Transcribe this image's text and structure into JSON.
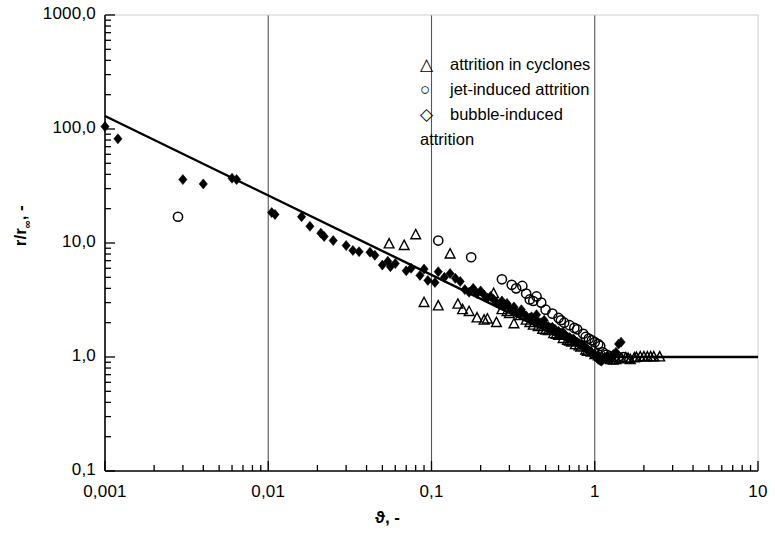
{
  "chart_data": {
    "type": "scatter",
    "title": "",
    "xlabel": "ϑ, -",
    "ylabel": "r/r∞, -",
    "xscale": "log",
    "yscale": "log",
    "xlim": [
      0.001,
      10
    ],
    "ylim": [
      0.1,
      1000
    ],
    "xticks": [
      "0,001",
      "0,01",
      "0,1",
      "1",
      "10"
    ],
    "xtick_values": [
      0.001,
      0.01,
      0.1,
      1,
      10
    ],
    "yticks": [
      "0,1",
      "1,0",
      "10,0",
      "100,0",
      "1000,0"
    ],
    "ytick_values": [
      0.1,
      1,
      10,
      100,
      1000
    ],
    "grid": "vertical gridlines at x = 0,01 / 0,1 / 1",
    "legend_position": "top-right inside axes",
    "legend": [
      {
        "marker": "triangle-open",
        "label": "attrition in cyclones"
      },
      {
        "marker": "circle-open",
        "label": "jet-induced attrition"
      },
      {
        "marker": "diamond-open",
        "label": "bubble-induced attrition"
      }
    ],
    "annotations": [
      {
        "text": "fit line: power law r/r∞ ≈ ϑ^-0,5 for ϑ < 1, constant r/r∞ = 1 for ϑ > 1"
      }
    ],
    "series": [
      {
        "name": "filled diamonds (measured data)",
        "marker": "diamond-filled",
        "color": "#000000",
        "points": [
          [
            0.001,
            105
          ],
          [
            0.0012,
            82
          ],
          [
            0.003,
            36
          ],
          [
            0.004,
            33
          ],
          [
            0.006,
            37
          ],
          [
            0.0064,
            36
          ],
          [
            0.0105,
            18.5
          ],
          [
            0.011,
            17.8
          ],
          [
            0.016,
            17.0
          ],
          [
            0.021,
            12.2
          ],
          [
            0.022,
            11.4
          ],
          [
            0.033,
            8.6
          ],
          [
            0.036,
            8.4
          ],
          [
            0.042,
            8.3
          ],
          [
            0.05,
            6.4
          ],
          [
            0.054,
            6.9
          ],
          [
            0.056,
            6.2
          ],
          [
            0.07,
            5.7
          ],
          [
            0.085,
            5.2
          ],
          [
            0.095,
            4.7
          ],
          [
            0.105,
            4.5
          ],
          [
            0.11,
            5.6
          ],
          [
            0.13,
            5.4
          ],
          [
            0.15,
            4.6
          ],
          [
            0.16,
            3.9
          ],
          [
            0.17,
            3.7
          ],
          [
            0.19,
            3.6
          ],
          [
            0.21,
            3.5
          ],
          [
            0.22,
            3.3
          ],
          [
            0.24,
            3.2
          ],
          [
            0.25,
            3.0
          ],
          [
            0.26,
            2.9
          ],
          [
            0.28,
            2.8
          ],
          [
            0.3,
            2.7
          ],
          [
            0.31,
            2.6
          ],
          [
            0.33,
            2.5
          ],
          [
            0.35,
            2.4
          ],
          [
            0.36,
            2.45
          ],
          [
            0.38,
            2.3
          ],
          [
            0.4,
            2.2
          ],
          [
            0.41,
            2.25
          ],
          [
            0.43,
            2.1
          ],
          [
            0.45,
            2.05
          ],
          [
            0.47,
            2.0
          ],
          [
            0.48,
            1.95
          ],
          [
            0.5,
            1.9
          ],
          [
            0.52,
            1.85
          ],
          [
            0.54,
            1.8
          ],
          [
            0.55,
            1.82
          ],
          [
            0.57,
            1.75
          ],
          [
            0.58,
            1.7
          ],
          [
            0.6,
            1.68
          ],
          [
            0.62,
            1.62
          ],
          [
            0.63,
            1.6
          ],
          [
            0.65,
            1.58
          ],
          [
            0.66,
            1.55
          ],
          [
            0.68,
            1.5
          ],
          [
            0.7,
            1.48
          ],
          [
            0.71,
            1.45
          ],
          [
            0.73,
            1.42
          ],
          [
            0.75,
            1.4
          ],
          [
            0.76,
            1.38
          ],
          [
            0.78,
            1.35
          ],
          [
            0.8,
            1.32
          ],
          [
            0.81,
            1.3
          ],
          [
            0.83,
            1.28
          ],
          [
            0.85,
            1.25
          ],
          [
            0.86,
            1.22
          ],
          [
            0.88,
            1.2
          ],
          [
            0.9,
            1.18
          ],
          [
            0.91,
            1.15
          ],
          [
            0.93,
            1.12
          ],
          [
            0.95,
            1.1
          ],
          [
            0.96,
            1.08
          ],
          [
            0.98,
            1.05
          ],
          [
            1.0,
            1.02
          ],
          [
            1.02,
            1.0
          ],
          [
            1.04,
            0.98
          ],
          [
            1.05,
            0.95
          ],
          [
            1.08,
            0.93
          ],
          [
            1.1,
            0.92
          ],
          [
            1.12,
            0.95
          ],
          [
            1.15,
            0.98
          ],
          [
            1.18,
            1.0
          ],
          [
            1.2,
            1.02
          ],
          [
            1.25,
            1.0
          ],
          [
            1.3,
            1.05
          ],
          [
            1.35,
            1.1
          ],
          [
            1.4,
            1.3
          ],
          [
            1.45,
            1.35
          ],
          [
            0.44,
            2.35
          ],
          [
            0.49,
            2.1
          ],
          [
            0.355,
            2.6
          ],
          [
            0.32,
            2.75
          ],
          [
            0.29,
            2.95
          ],
          [
            0.27,
            3.1
          ],
          [
            0.23,
            3.4
          ],
          [
            0.2,
            3.8
          ],
          [
            0.18,
            4.0
          ],
          [
            0.14,
            4.9
          ],
          [
            0.12,
            5.0
          ],
          [
            0.09,
            5.9
          ],
          [
            0.075,
            6.0
          ],
          [
            0.06,
            6.6
          ],
          [
            0.045,
            7.8
          ],
          [
            0.03,
            9.5
          ],
          [
            0.025,
            10.5
          ],
          [
            0.018,
            14.0
          ],
          [
            0.64,
            1.65
          ],
          [
            0.74,
            1.44
          ],
          [
            0.84,
            1.26
          ],
          [
            0.94,
            1.11
          ],
          [
            1.01,
            1.01
          ]
        ]
      },
      {
        "name": "attrition in cyclones",
        "marker": "triangle-open",
        "color": "#000000",
        "points": [
          [
            0.055,
            9.8
          ],
          [
            0.068,
            9.5
          ],
          [
            0.08,
            11.8
          ],
          [
            0.09,
            3.0
          ],
          [
            0.13,
            8.0
          ],
          [
            0.155,
            2.6
          ],
          [
            0.17,
            2.5
          ],
          [
            0.19,
            2.2
          ],
          [
            0.21,
            2.1
          ],
          [
            0.24,
            3.6
          ],
          [
            0.25,
            2.0
          ],
          [
            0.27,
            2.6
          ],
          [
            0.3,
            2.4
          ],
          [
            0.32,
            1.95
          ],
          [
            0.35,
            2.3
          ],
          [
            0.38,
            2.1
          ],
          [
            0.42,
            1.9
          ],
          [
            0.45,
            1.85
          ],
          [
            0.48,
            1.75
          ],
          [
            0.52,
            1.7
          ],
          [
            0.56,
            1.6
          ],
          [
            0.6,
            1.55
          ],
          [
            0.64,
            1.45
          ],
          [
            0.68,
            1.4
          ],
          [
            0.72,
            1.35
          ],
          [
            0.76,
            1.28
          ],
          [
            0.82,
            1.22
          ],
          [
            0.88,
            1.15
          ],
          [
            0.95,
            1.1
          ],
          [
            1.05,
            1.02
          ],
          [
            1.15,
            0.98
          ],
          [
            1.25,
            0.95
          ],
          [
            1.35,
            0.95
          ],
          [
            1.45,
            0.96
          ],
          [
            1.55,
            0.98
          ],
          [
            1.65,
            0.95
          ],
          [
            1.75,
            0.98
          ],
          [
            1.9,
            1.0
          ],
          [
            2.1,
            1.0
          ],
          [
            2.3,
            1.0
          ],
          [
            2.5,
            1.0
          ],
          [
            0.11,
            2.8
          ],
          [
            0.145,
            2.9
          ],
          [
            0.22,
            2.15
          ],
          [
            0.29,
            2.5
          ],
          [
            0.4,
            2.0
          ],
          [
            0.5,
            1.72
          ],
          [
            0.58,
            1.58
          ],
          [
            0.7,
            1.38
          ],
          [
            0.8,
            1.25
          ],
          [
            0.9,
            1.12
          ],
          [
            1.0,
            1.05
          ],
          [
            1.1,
            1.0
          ],
          [
            1.2,
            0.96
          ],
          [
            1.3,
            0.94
          ],
          [
            1.6,
            0.97
          ],
          [
            1.8,
            0.99
          ],
          [
            2.0,
            1.0
          ],
          [
            2.2,
            1.0
          ]
        ]
      },
      {
        "name": "jet-induced attrition",
        "marker": "circle-open",
        "color": "#000000",
        "points": [
          [
            0.0028,
            17.0
          ],
          [
            0.11,
            10.5
          ],
          [
            0.175,
            7.5
          ],
          [
            0.27,
            4.8
          ],
          [
            0.31,
            4.3
          ],
          [
            0.36,
            4.2
          ],
          [
            0.4,
            3.2
          ],
          [
            0.44,
            3.4
          ],
          [
            0.47,
            3.0
          ],
          [
            0.5,
            2.6
          ],
          [
            0.55,
            2.4
          ],
          [
            0.6,
            2.2
          ],
          [
            0.65,
            2.0
          ],
          [
            0.7,
            1.9
          ],
          [
            0.78,
            1.75
          ],
          [
            0.85,
            1.6
          ],
          [
            0.92,
            1.45
          ],
          [
            1.0,
            1.35
          ],
          [
            1.08,
            1.25
          ],
          [
            1.12,
            1.1
          ],
          [
            1.18,
            1.05
          ],
          [
            1.25,
            1.02
          ],
          [
            1.32,
            1.0
          ],
          [
            1.4,
            1.0
          ],
          [
            1.5,
            1.0
          ],
          [
            0.33,
            4.0
          ],
          [
            0.38,
            3.6
          ],
          [
            0.42,
            3.1
          ],
          [
            0.62,
            2.1
          ],
          [
            0.75,
            1.8
          ],
          [
            0.88,
            1.5
          ],
          [
            0.96,
            1.4
          ],
          [
            1.05,
            1.3
          ]
        ]
      }
    ],
    "fit_line": {
      "name": "model fit",
      "color": "#000000",
      "segments": [
        {
          "from": [
            0.001,
            130
          ],
          "to": [
            1.08,
            1.0
          ]
        },
        {
          "from": [
            1.08,
            1.0
          ],
          "to": [
            10.0,
            1.0
          ]
        }
      ]
    }
  }
}
